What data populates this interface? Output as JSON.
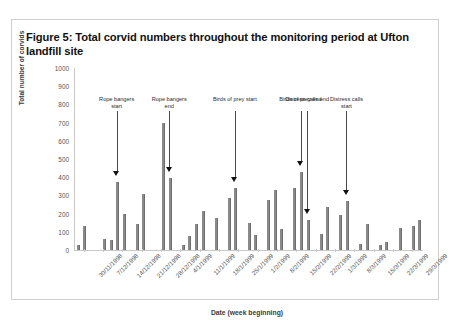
{
  "figure": {
    "caption": "Figure 5: Total corvid numbers throughout the monitoring period at Ufton landfill site"
  },
  "chart_data": {
    "type": "bar",
    "title": "Total corvid numbers throughout the monitoring period at Ufton landfill site",
    "xlabel": "Date (week beginning)",
    "ylabel": "Total number of corvids",
    "ylim": [
      0,
      1000
    ],
    "ytick_labels": [
      "0",
      "100",
      "200",
      "300",
      "400",
      "500",
      "600",
      "700",
      "800",
      "900",
      "1000"
    ],
    "ytick_values": [
      0,
      100,
      200,
      300,
      400,
      500,
      600,
      700,
      800,
      900,
      1000
    ],
    "grid": false,
    "legend": "none",
    "bar_color": "#8a8a8a",
    "xtick_labels": [
      "30/11/1998",
      "7/12/1998",
      "14/12/1998",
      "21/12/1998",
      "28/12/1998",
      "4/1/1999",
      "11/1/1999",
      "18/1/1999",
      "25/1/1999",
      "1/2/1999",
      "8/2/1999",
      "15/2/1999",
      "22/2/1999",
      "1/3/1999",
      "8/3/1999",
      "15/3/1999",
      "22/3/1999",
      "29/3/1999"
    ],
    "values": [
      30,
      130,
      0,
      0,
      60,
      55,
      375,
      200,
      0,
      145,
      310,
      0,
      0,
      700,
      395,
      0,
      25,
      75,
      145,
      215,
      0,
      175,
      0,
      285,
      340,
      0,
      150,
      80,
      0,
      275,
      330,
      115,
      0,
      340,
      430,
      165,
      0,
      90,
      235,
      0,
      190,
      270,
      0,
      35,
      145,
      0,
      25,
      45,
      0,
      120,
      0,
      130,
      165
    ],
    "annotations": [
      {
        "label": "Rope bangers start",
        "at_value": 375
      },
      {
        "label": "Rope bangers end",
        "at_value": 395
      },
      {
        "label": "Birds of prey start",
        "at_value": 340
      },
      {
        "label": "Birds of prey end",
        "at_value": 430
      },
      {
        "label": "Distress calls start",
        "at_value": 270
      },
      {
        "label": "Distress calls end",
        "at_value": 165
      }
    ]
  }
}
